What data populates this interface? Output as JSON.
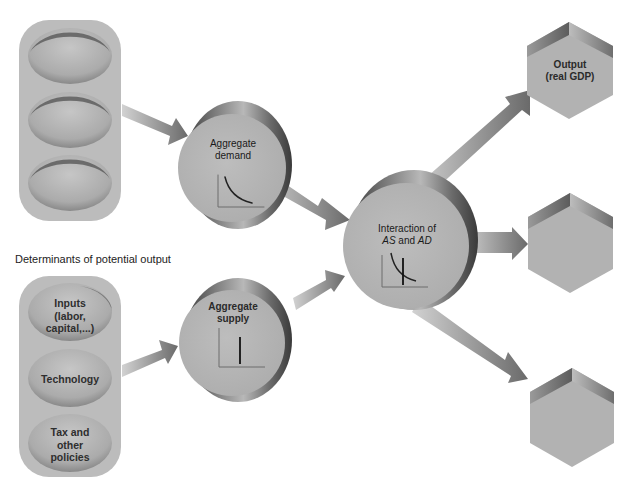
{
  "diagram": {
    "section_label": "Determinants of potential output",
    "left_top_group": {
      "items": [
        "",
        "",
        ""
      ]
    },
    "left_bottom_group": {
      "items": [
        {
          "lines": [
            "Inputs",
            "(labor,",
            "capital,...)"
          ]
        },
        {
          "lines": [
            "Technology"
          ]
        },
        {
          "lines": [
            "Tax and",
            "other",
            "policies"
          ]
        }
      ]
    },
    "aggregate_demand": {
      "lines": [
        "Aggregate",
        "demand"
      ],
      "graph": "downward-sloping-curve"
    },
    "aggregate_supply": {
      "lines": [
        "Aggregate",
        "supply"
      ],
      "graph": "vertical-line"
    },
    "interaction": {
      "line1": "Interaction of",
      "line2_parts": [
        {
          "text": "AS",
          "italic": true
        },
        {
          "text": " and ",
          "italic": false
        },
        {
          "text": "AD",
          "italic": true
        }
      ],
      "graph": "curve-crossing-vertical-line"
    },
    "outputs": [
      {
        "lines": [
          "Output",
          "(real GDP)"
        ]
      },
      {
        "lines": []
      },
      {
        "lines": []
      }
    ],
    "colors": {
      "background": "#ffffff",
      "pill_fill": "#bdbdbd",
      "dome_fill": "#b4b4b4",
      "cylinder_face": "#b6b6b6",
      "cylinder_rim_dark": "#5a5a5a",
      "arrow_light": "#cfcfcf",
      "arrow_dark": "#6e6e6e",
      "hex_face": "#b0b0b0",
      "hex_top_dark": "#6a6a6a",
      "text": "#222222"
    }
  }
}
